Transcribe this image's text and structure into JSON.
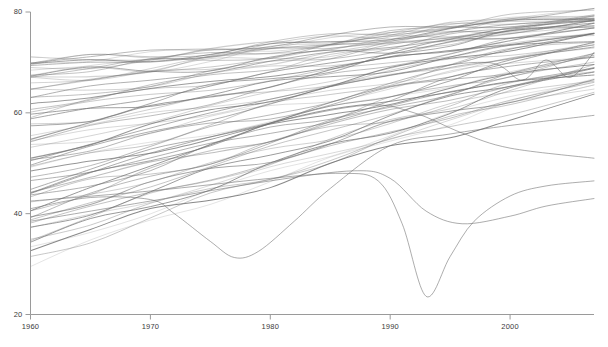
{
  "chart_data": {
    "type": "line",
    "title": "",
    "subtitle": "",
    "xlabel": "",
    "ylabel": "",
    "xlim": [
      1960,
      2007
    ],
    "ylim": [
      20,
      80
    ],
    "xticks": [
      1960,
      1970,
      1980,
      1990,
      2000
    ],
    "yticks": [
      20,
      40,
      60,
      80
    ],
    "xtick_labels": [
      "1960",
      "1970",
      "1980",
      "1990",
      "2000"
    ],
    "ytick_labels": [
      "20",
      "40",
      "60",
      "80"
    ],
    "grid": false,
    "legend": false,
    "legend_position": "none",
    "axis_color": "#9a9a9a",
    "line_color": "#6f6f6f",
    "background": "#ffffff",
    "n_series": 64,
    "x": [
      1960,
      1965,
      1970,
      1975,
      1980,
      1985,
      1990,
      1995,
      2000,
      2007
    ],
    "series": [
      {
        "name": "s01",
        "values": [
          69.5,
          70.4,
          71.2,
          72.1,
          73.1,
          74.3,
          75.5,
          76.6,
          77.6,
          78.7
        ]
      },
      {
        "name": "s02",
        "values": [
          69.1,
          70.1,
          70.9,
          71.8,
          72.9,
          74.1,
          75.3,
          76.5,
          77.6,
          78.9
        ]
      },
      {
        "name": "s03",
        "values": [
          70.2,
          70.9,
          71.4,
          72.2,
          73.4,
          74.6,
          75.9,
          77.1,
          78.3,
          79.6
        ]
      },
      {
        "name": "s04",
        "values": [
          68.6,
          69.6,
          70.6,
          71.6,
          72.8,
          74.2,
          75.6,
          76.9,
          78.1,
          79.5
        ]
      },
      {
        "name": "s05",
        "values": [
          67.9,
          69.0,
          70.1,
          71.3,
          72.6,
          74.0,
          75.4,
          76.8,
          78.0,
          79.4
        ]
      },
      {
        "name": "s06",
        "values": [
          70.6,
          71.2,
          71.7,
          72.6,
          73.8,
          75.1,
          76.4,
          77.6,
          78.8,
          80.1
        ]
      },
      {
        "name": "s07",
        "values": [
          67.8,
          69.0,
          70.2,
          71.5,
          72.9,
          74.4,
          75.9,
          77.3,
          78.6,
          80.2
        ]
      },
      {
        "name": "s08",
        "values": [
          69.8,
          70.6,
          71.4,
          72.4,
          73.6,
          74.9,
          76.2,
          77.4,
          78.7,
          80.0
        ]
      },
      {
        "name": "s09",
        "values": [
          67.5,
          68.5,
          69.3,
          70.5,
          72.0,
          73.6,
          75.1,
          76.5,
          77.8,
          79.3
        ]
      },
      {
        "name": "s10",
        "values": [
          66.1,
          67.6,
          69.1,
          70.6,
          72.1,
          73.7,
          75.1,
          76.5,
          77.8,
          79.4
        ]
      },
      {
        "name": "s11",
        "values": [
          65.6,
          67.3,
          68.9,
          70.3,
          71.8,
          73.3,
          74.8,
          76.2,
          77.5,
          79.0
        ]
      },
      {
        "name": "s12",
        "values": [
          70.3,
          71.0,
          71.5,
          72.1,
          73.0,
          74.0,
          75.0,
          76.0,
          77.0,
          78.2
        ]
      },
      {
        "name": "s13",
        "values": [
          68.0,
          68.9,
          69.7,
          70.6,
          71.8,
          73.1,
          74.4,
          75.7,
          77.0,
          78.4
        ]
      },
      {
        "name": "s14",
        "values": [
          64.9,
          66.4,
          67.9,
          69.4,
          70.9,
          72.4,
          73.9,
          75.3,
          76.7,
          78.3
        ]
      },
      {
        "name": "s15",
        "values": [
          63.0,
          64.9,
          66.6,
          68.3,
          70.0,
          71.7,
          73.3,
          74.9,
          76.4,
          78.1
        ]
      },
      {
        "name": "s16",
        "values": [
          69.0,
          69.8,
          70.5,
          71.3,
          72.3,
          73.5,
          74.7,
          75.9,
          77.1,
          78.5
        ]
      },
      {
        "name": "s17",
        "values": [
          62.2,
          64.1,
          66.0,
          67.8,
          69.6,
          71.4,
          73.1,
          74.8,
          76.4,
          78.2
        ]
      },
      {
        "name": "s18",
        "values": [
          66.6,
          67.6,
          68.5,
          69.6,
          70.9,
          72.3,
          73.7,
          75.1,
          76.5,
          78.1
        ]
      },
      {
        "name": "s19",
        "values": [
          61.0,
          63.1,
          65.1,
          67.1,
          69.1,
          71.0,
          72.9,
          74.7,
          76.4,
          78.3
        ]
      },
      {
        "name": "s20",
        "values": [
          65.4,
          66.5,
          67.6,
          68.8,
          70.2,
          71.7,
          73.2,
          74.7,
          76.1,
          77.8
        ]
      },
      {
        "name": "s21",
        "values": [
          59.8,
          62.0,
          64.2,
          66.4,
          68.5,
          70.6,
          72.6,
          74.5,
          76.3,
          78.3
        ]
      },
      {
        "name": "s22",
        "values": [
          67.2,
          67.9,
          68.6,
          69.4,
          70.4,
          71.5,
          72.7,
          73.9,
          75.2,
          76.6
        ]
      },
      {
        "name": "s23",
        "values": [
          58.5,
          60.8,
          63.1,
          65.4,
          67.7,
          69.9,
          72.0,
          74.0,
          75.9,
          78.0
        ]
      },
      {
        "name": "s24",
        "values": [
          63.8,
          64.9,
          66.0,
          67.2,
          68.6,
          70.1,
          71.6,
          73.1,
          74.6,
          76.3
        ]
      },
      {
        "name": "s25",
        "values": [
          57.0,
          59.5,
          62.0,
          64.5,
          66.9,
          69.2,
          71.4,
          73.5,
          75.5,
          77.7
        ]
      },
      {
        "name": "s26",
        "values": [
          62.0,
          63.3,
          64.6,
          66.0,
          67.5,
          69.1,
          70.7,
          72.3,
          73.9,
          75.7
        ]
      },
      {
        "name": "s27",
        "values": [
          55.5,
          58.1,
          60.7,
          63.3,
          65.8,
          68.2,
          70.5,
          72.7,
          74.8,
          77.1
        ]
      },
      {
        "name": "s28",
        "values": [
          60.5,
          61.9,
          63.4,
          64.9,
          66.5,
          68.2,
          69.9,
          71.6,
          73.3,
          75.2
        ]
      },
      {
        "name": "s29",
        "values": [
          54.2,
          56.9,
          59.6,
          62.2,
          64.8,
          67.3,
          69.7,
          72.0,
          74.2,
          76.6
        ]
      },
      {
        "name": "s30",
        "values": [
          59.0,
          60.5,
          62.1,
          63.7,
          65.4,
          67.2,
          69.0,
          70.8,
          72.6,
          74.6
        ]
      },
      {
        "name": "s31",
        "values": [
          52.8,
          55.6,
          58.4,
          61.2,
          63.9,
          66.5,
          69.0,
          71.4,
          73.7,
          76.2
        ]
      },
      {
        "name": "s32",
        "values": [
          57.5,
          59.1,
          60.8,
          62.5,
          64.3,
          66.2,
          68.1,
          70.0,
          71.9,
          74.0
        ]
      },
      {
        "name": "s33",
        "values": [
          51.4,
          54.3,
          57.2,
          60.1,
          62.9,
          65.6,
          68.2,
          70.7,
          73.1,
          75.7
        ]
      },
      {
        "name": "s34",
        "values": [
          56.0,
          57.7,
          59.5,
          61.3,
          63.2,
          65.2,
          67.2,
          69.2,
          71.2,
          73.4
        ]
      },
      {
        "name": "s35",
        "values": [
          50.0,
          53.0,
          56.0,
          59.0,
          61.9,
          64.7,
          67.4,
          70.0,
          72.5,
          75.2
        ]
      },
      {
        "name": "s36",
        "values": [
          54.4,
          56.2,
          58.1,
          60.0,
          62.0,
          64.1,
          66.2,
          68.3,
          70.4,
          72.7
        ]
      },
      {
        "name": "s37",
        "values": [
          48.5,
          51.6,
          54.7,
          57.8,
          60.8,
          63.7,
          66.5,
          69.2,
          71.8,
          74.6
        ]
      },
      {
        "name": "s38",
        "values": [
          52.8,
          54.7,
          56.7,
          58.7,
          60.8,
          63.0,
          65.2,
          67.4,
          69.6,
          72.0
        ]
      },
      {
        "name": "s39",
        "values": [
          47.0,
          50.2,
          53.4,
          56.6,
          59.7,
          62.7,
          65.6,
          68.4,
          71.1,
          74.0
        ]
      },
      {
        "name": "s40",
        "values": [
          51.2,
          53.2,
          55.3,
          57.4,
          59.6,
          61.9,
          64.2,
          66.5,
          68.8,
          71.3
        ]
      },
      {
        "name": "s41",
        "values": [
          45.5,
          48.8,
          52.1,
          55.4,
          58.6,
          61.7,
          64.7,
          67.6,
          70.4,
          73.4
        ]
      },
      {
        "name": "s42",
        "values": [
          49.6,
          51.7,
          53.9,
          56.1,
          58.4,
          60.8,
          63.2,
          65.6,
          68.0,
          70.6
        ]
      },
      {
        "name": "s43",
        "values": [
          44.0,
          47.4,
          50.8,
          54.2,
          57.5,
          60.7,
          63.8,
          66.8,
          69.7,
          72.8
        ]
      },
      {
        "name": "s44",
        "values": [
          48.0,
          50.2,
          52.5,
          54.8,
          57.2,
          59.7,
          62.2,
          64.7,
          67.2,
          69.9
        ]
      },
      {
        "name": "s45",
        "values": [
          42.6,
          46.0,
          49.5,
          53.0,
          56.4,
          59.7,
          62.9,
          66.0,
          69.0,
          72.2
        ]
      },
      {
        "name": "s46",
        "values": [
          46.4,
          48.7,
          51.1,
          53.5,
          56.0,
          58.6,
          61.2,
          63.8,
          66.4,
          69.2
        ]
      },
      {
        "name": "s47",
        "values": [
          41.2,
          44.7,
          48.2,
          51.8,
          55.3,
          58.7,
          62.0,
          65.2,
          68.3,
          71.6
        ]
      },
      {
        "name": "s48",
        "values": [
          44.8,
          47.2,
          49.7,
          52.2,
          54.8,
          57.5,
          60.2,
          62.9,
          65.6,
          68.5
        ]
      },
      {
        "name": "s49",
        "values": [
          39.8,
          43.4,
          47.0,
          50.6,
          54.2,
          57.7,
          61.1,
          64.4,
          67.6,
          71.0
        ]
      },
      {
        "name": "s50",
        "values": [
          43.2,
          45.7,
          48.3,
          50.9,
          53.6,
          56.4,
          59.2,
          62.0,
          64.8,
          67.8
        ]
      },
      {
        "name": "s51",
        "values": [
          38.4,
          42.0,
          45.7,
          49.4,
          53.0,
          56.6,
          60.1,
          63.5,
          66.8,
          70.3
        ]
      },
      {
        "name": "s52",
        "values": [
          41.6,
          44.2,
          46.9,
          49.6,
          52.4,
          55.3,
          58.2,
          61.1,
          64.0,
          67.1
        ]
      },
      {
        "name": "s53",
        "values": [
          37.0,
          40.7,
          44.4,
          48.1,
          51.8,
          55.4,
          59.0,
          62.5,
          65.9,
          69.5
        ]
      },
      {
        "name": "s54",
        "values": [
          40.0,
          42.7,
          45.5,
          48.3,
          51.2,
          54.2,
          57.2,
          60.2,
          63.2,
          66.4
        ]
      },
      {
        "name": "s55",
        "values": [
          35.6,
          39.3,
          43.1,
          46.8,
          50.6,
          54.3,
          57.9,
          61.5,
          65.0,
          68.7
        ]
      },
      {
        "name": "s56",
        "values": [
          38.4,
          41.2,
          44.1,
          47.0,
          50.0,
          53.1,
          56.2,
          59.3,
          62.4,
          65.7
        ]
      },
      {
        "name": "s57",
        "values": [
          34.2,
          38.0,
          41.8,
          45.6,
          49.4,
          53.1,
          56.8,
          60.4,
          64.0,
          67.8
        ]
      },
      {
        "name": "s58",
        "values": [
          36.8,
          39.7,
          42.7,
          45.7,
          48.8,
          52.0,
          55.2,
          58.4,
          61.6,
          65.0
        ]
      },
      {
        "name": "s59",
        "values": [
          32.8,
          36.6,
          40.5,
          44.3,
          48.1,
          51.9,
          55.7,
          59.4,
          63.1,
          66.9
        ]
      },
      {
        "name": "s60",
        "values": [
          31.2,
          35.2,
          39.2,
          43.1,
          47.0,
          50.9,
          54.7,
          58.5,
          62.3,
          66.2
        ]
      },
      {
        "name": "s61",
        "values": [
          35.4,
          38.4,
          41.4,
          44.5,
          47.6,
          50.8,
          54.0,
          57.2,
          60.5,
          63.9
        ]
      },
      {
        "name": "s62",
        "values": [
          33.8,
          36.8,
          39.9,
          43.0,
          46.2,
          49.4,
          52.6,
          55.9,
          59.2,
          62.7
        ]
      },
      {
        "name": "s63",
        "values": [
          30.0,
          34.2,
          38.4,
          42.5,
          46.5,
          50.5,
          54.4,
          58.3,
          62.1,
          66.1
        ]
      },
      {
        "name": "s64",
        "values": [
          40.5,
          44.8,
          49.6,
          54.0,
          57.6,
          60.4,
          62.6,
          64.3,
          65.8,
          67.4
        ]
      }
    ],
    "outliers": [
      {
        "name": "dip-1977",
        "x": [
          1960,
          1965,
          1970,
          1972,
          1975,
          1977,
          1979,
          1982,
          1985,
          1990,
          1995,
          2000,
          2007
        ],
        "values": [
          41.0,
          43.2,
          42.8,
          40.0,
          34.5,
          31.3,
          32.5,
          38.5,
          45.0,
          53.5,
          55.8,
          57.5,
          59.5
        ]
      },
      {
        "name": "dip-1993",
        "x": [
          1960,
          1970,
          1980,
          1986,
          1989,
          1991,
          1993,
          1995,
          1997,
          2000,
          2003,
          2007
        ],
        "values": [
          42.5,
          44.5,
          47.0,
          48.0,
          46.5,
          38.0,
          23.6,
          31.5,
          38.5,
          43.5,
          45.5,
          46.5
        ]
      },
      {
        "name": "dip-1993b",
        "x": [
          1960,
          1970,
          1980,
          1987,
          1990,
          1993,
          1996,
          2000,
          2003,
          2007
        ],
        "values": [
          38.5,
          42.5,
          46.5,
          48.5,
          47.0,
          40.5,
          38.0,
          39.5,
          41.5,
          43.0
        ]
      },
      {
        "name": "notch-2002",
        "x": [
          1960,
          1975,
          1990,
          1998,
          2001,
          2003,
          2005,
          2007
        ],
        "values": [
          50.5,
          60.0,
          67.5,
          70.0,
          66.5,
          70.5,
          67.0,
          72.0
        ]
      },
      {
        "name": "plateau-decline",
        "x": [
          1960,
          1970,
          1980,
          1988,
          1992,
          1996,
          2000,
          2007
        ],
        "values": [
          44.0,
          52.0,
          58.0,
          61.5,
          60.0,
          56.0,
          53.0,
          51.0
        ]
      }
    ]
  },
  "caption": {
    "text": "",
    "visible": false
  }
}
